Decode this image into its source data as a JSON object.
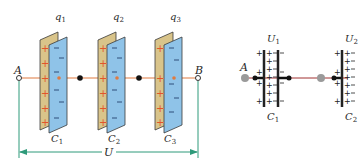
{
  "left_diagram": {
    "terminal_a": "A",
    "terminal_b": "B",
    "voltage_label": "U",
    "capacitors": [
      {
        "name": "C",
        "index": "1",
        "charge": "q",
        "charge_index": "1"
      },
      {
        "name": "C",
        "index": "2",
        "charge": "q",
        "charge_index": "2"
      },
      {
        "name": "C",
        "index": "3",
        "charge": "q",
        "charge_index": "3"
      }
    ],
    "plus_sign": "+",
    "minus_sign": "−"
  },
  "right_diagram": {
    "terminal_a": "A",
    "capacitors": [
      {
        "name": "C",
        "index": "1",
        "voltage": "U",
        "voltage_index": "1"
      },
      {
        "name": "C",
        "index": "2",
        "voltage": "U",
        "voltage_index": "2"
      }
    ]
  },
  "colors": {
    "wire": "#e07a40",
    "positive_plate": "#d9c48a",
    "negative_plate": "#8fc3e8",
    "plus": "#e2552a",
    "minus": "#2f4f7a",
    "dimension_line": "#2e9a7a",
    "right_wire": "#a03030"
  }
}
